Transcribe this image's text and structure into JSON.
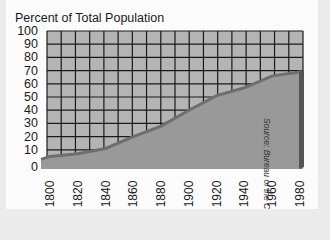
{
  "chart_data": {
    "type": "area",
    "title": "Percent of Total Population",
    "xlabel": "",
    "ylabel": "Percent of Total Population",
    "categories": [
      "1800",
      "1820",
      "1840",
      "1860",
      "1880",
      "1900",
      "1920",
      "1940",
      "1960",
      "1980"
    ],
    "series": [
      {
        "name": "Urban population (% of total)",
        "values": [
          5,
          7,
          11,
          20,
          28,
          40,
          51,
          57,
          66,
          69
        ]
      }
    ],
    "ylim": [
      0,
      100
    ],
    "yticks": [
      "100",
      "90",
      "80",
      "70",
      "60",
      "50",
      "40",
      "30",
      "20",
      "10",
      "0"
    ],
    "grid": true,
    "legend": "none",
    "annotations": [
      "Source: Bureau of the Census"
    ]
  },
  "title": "Percent of Total Population",
  "source": "Source: Bureau of the Census",
  "colors": {
    "grid_bg": "#b4b4b4",
    "grid_line": "#1a1a1a",
    "area_fill": "#999999",
    "area_edge": "#6e6e6e",
    "side": "#555555"
  }
}
